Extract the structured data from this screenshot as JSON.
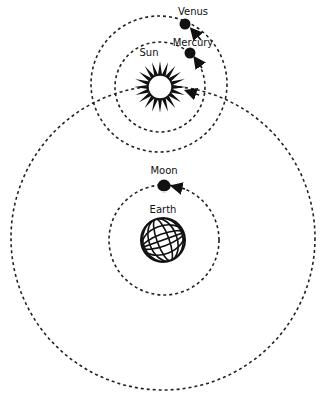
{
  "diagram": {
    "bodies": {
      "venus": {
        "label": "Venus"
      },
      "mercury": {
        "label": "Mercury"
      },
      "sun": {
        "label": "Sun"
      },
      "moon": {
        "label": "Moon"
      },
      "earth": {
        "label": "Earth"
      }
    },
    "colors": {
      "ink": "#111111",
      "background": "#ffffff"
    }
  }
}
